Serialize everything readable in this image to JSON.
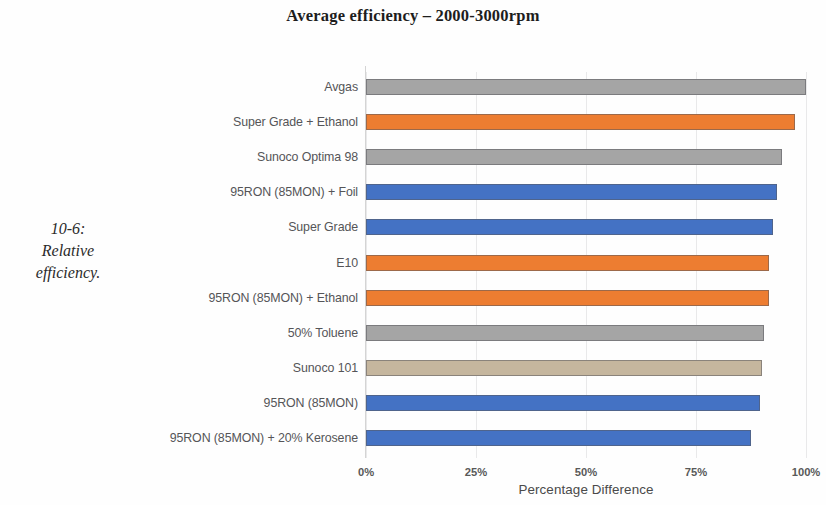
{
  "caption": {
    "line1": "10-6:",
    "line2": "Relative",
    "line3": "efficiency."
  },
  "chart_data": {
    "type": "bar",
    "orientation": "horizontal",
    "title": "Average efficiency – 2000-3000rpm",
    "xlabel": "Percentage Difference",
    "ylabel": "",
    "xlim": [
      0,
      100
    ],
    "xticks": [
      "0%",
      "25%",
      "50%",
      "75%",
      "100%"
    ],
    "xtick_values": [
      0,
      25,
      50,
      75,
      100
    ],
    "grid": true,
    "legend": "none",
    "categories": [
      "Avgas",
      "Super Grade + Ethanol",
      "Sunoco Optima 98",
      "95RON (85MON) + Foil",
      "Super Grade",
      "E10",
      "95RON (85MON) + Ethanol",
      "50% Toluene",
      "Sunoco 101",
      "95RON (85MON)",
      "95RON (85MON)  + 20% Kerosene"
    ],
    "values": [
      100,
      97.5,
      94.5,
      93.5,
      92.5,
      91.5,
      91.5,
      90.5,
      90,
      89.5,
      87.5
    ],
    "bar_colors": [
      "#A5A5A5",
      "#ED7D31",
      "#A5A5A5",
      "#4472C4",
      "#4472C4",
      "#ED7D31",
      "#ED7D31",
      "#A5A5A5",
      "#C5B69E",
      "#4472C4",
      "#4472C4"
    ],
    "colors": {
      "gray": "#A5A5A5",
      "orange": "#ED7D31",
      "blue": "#4472C4",
      "tan": "#C5B69E",
      "gridline": "#E9E9EA",
      "text": "#555558"
    }
  }
}
